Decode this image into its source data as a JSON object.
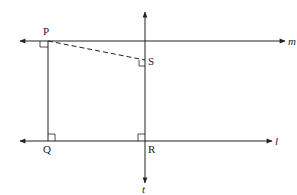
{
  "diagram": {
    "lines": [
      {
        "name": "m",
        "label": "m",
        "type": "horizontal",
        "y": 41
      },
      {
        "name": "l",
        "label": "l",
        "type": "horizontal",
        "y": 141
      },
      {
        "name": "t",
        "label": "t",
        "type": "vertical",
        "x": 145
      }
    ],
    "points": [
      {
        "name": "P",
        "label": "P"
      },
      {
        "name": "Q",
        "label": "Q"
      },
      {
        "name": "R",
        "label": "R"
      },
      {
        "name": "S",
        "label": "S"
      }
    ],
    "segments": [
      {
        "from": "P",
        "to": "Q",
        "style": "solid"
      },
      {
        "from": "P",
        "to": "S",
        "style": "dashed"
      }
    ],
    "right_angles": [
      "P",
      "Q",
      "R",
      "S"
    ],
    "colors": {
      "stroke": "#222222",
      "background": "#ffffff"
    }
  }
}
